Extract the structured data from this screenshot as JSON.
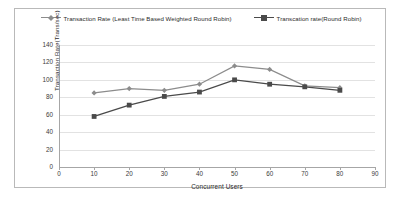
{
  "chart_data": {
    "type": "line",
    "title": "",
    "xlabel": "Concurrent Users",
    "ylabel": "Transaction Rate(Trans/sec)",
    "x": [
      10,
      20,
      30,
      40,
      50,
      60,
      70,
      80
    ],
    "xlim": [
      0,
      90
    ],
    "ylim": [
      0,
      140
    ],
    "xticks": [
      0,
      10,
      20,
      30,
      40,
      50,
      60,
      70,
      80,
      90
    ],
    "yticks": [
      0,
      20,
      40,
      60,
      80,
      100,
      120,
      140
    ],
    "grid": "horizontal",
    "legend_position": "top",
    "series": [
      {
        "name": "Transaction Rate (Least Time Based Weighted Round Robin)",
        "values": [
          85,
          90,
          88,
          95,
          116,
          112,
          93,
          91
        ],
        "color": "#8c8c8c",
        "marker": "diamond"
      },
      {
        "name": "Transcation rate(Round Robin)",
        "values": [
          58,
          71,
          81,
          86,
          100,
          95,
          92,
          88
        ],
        "color": "#4a4a4a",
        "marker": "square"
      }
    ]
  }
}
